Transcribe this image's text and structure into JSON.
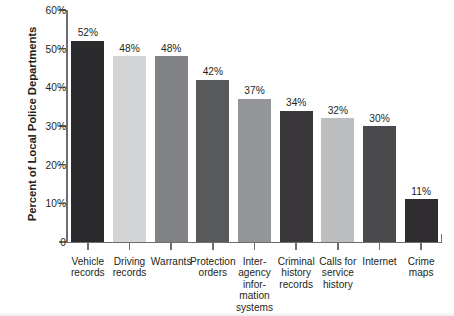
{
  "chart_data": {
    "type": "bar",
    "title": "",
    "subtitle": "",
    "xlabel": "",
    "ylabel": "Percent of Local Police Departments",
    "ylim": [
      0,
      60
    ],
    "ytick_labels": [
      "0",
      "10%",
      "20%",
      "30%",
      "40%",
      "50%",
      "60%"
    ],
    "ytick_values": [
      0,
      10,
      20,
      30,
      40,
      50,
      60
    ],
    "grid": false,
    "legend": null,
    "categories": [
      "Vehicle records",
      "Driving records",
      "Warrants",
      "Protection orders",
      "Inter-agency information systems",
      "Criminal history records",
      "Calls for service history",
      "Internet",
      "Crime maps"
    ],
    "category_lines": [
      [
        "Vehicle",
        "records"
      ],
      [
        "Driving",
        "records"
      ],
      [
        "Warrants"
      ],
      [
        "Protection",
        "orders"
      ],
      [
        "Inter-",
        "agency",
        "infor-",
        "mation",
        "systems"
      ],
      [
        "Criminal",
        "history",
        "records"
      ],
      [
        "Calls for",
        "service",
        "history"
      ],
      [
        "Internet"
      ],
      [
        "Crime",
        "maps"
      ]
    ],
    "values": [
      52,
      48,
      48,
      42,
      37,
      34,
      32,
      30,
      11
    ],
    "data_labels": [
      "52%",
      "48%",
      "48%",
      "42%",
      "37%",
      "34%",
      "32%",
      "30%",
      "11%"
    ],
    "bar_colors": [
      "#2b2a2c",
      "#d3d4d6",
      "#808285",
      "#58595b",
      "#939598",
      "#3a383b",
      "#bcbec0",
      "#4a4a4d",
      "#2e2c2f"
    ],
    "axis_color": "#6d6e71",
    "text_color": "#231f20",
    "background": "#ffffff"
  }
}
